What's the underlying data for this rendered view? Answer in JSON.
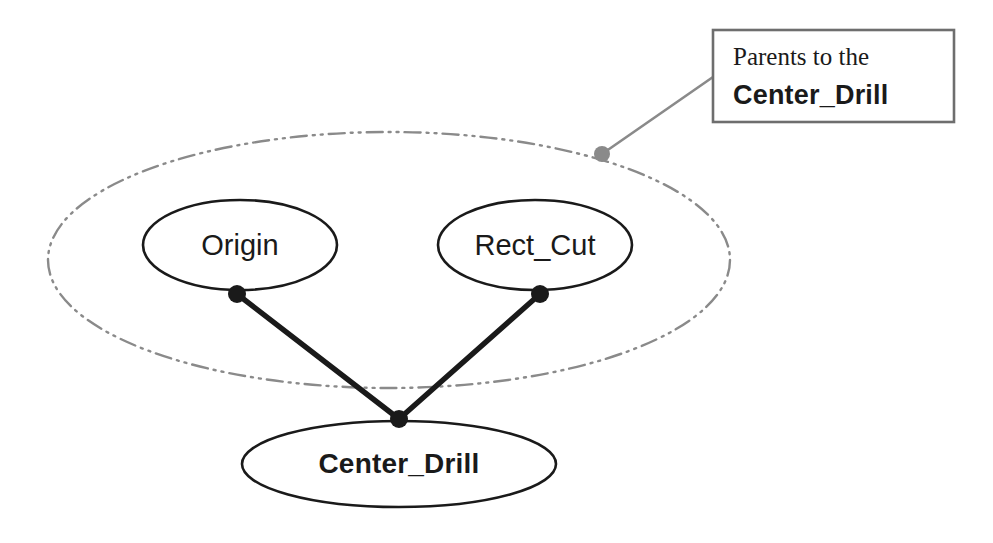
{
  "diagram": {
    "title": "Parents to the Center_Drill",
    "type": "feature-parent-child-tree",
    "colors": {
      "node_stroke": "#1a1a1a",
      "group_stroke": "#8a8a8a",
      "edge": "#1a1a1a",
      "leader": "#8a8a8a",
      "callout_border": "#6e6e6e",
      "background": "#ffffff"
    },
    "group": {
      "name": "parents-group",
      "shape": "ellipse",
      "style": "dash-dot-dot",
      "cx": 389,
      "cy": 260,
      "rx": 341,
      "ry": 128
    },
    "nodes": [
      {
        "id": "origin",
        "label": "Origin",
        "bold": false,
        "cx": 240,
        "cy": 245,
        "rx": 97,
        "ry": 45,
        "anchor": {
          "x": 237,
          "y": 294
        }
      },
      {
        "id": "rect_cut",
        "label": "Rect_Cut",
        "bold": false,
        "cx": 535,
        "cy": 245,
        "rx": 97,
        "ry": 45,
        "anchor": {
          "x": 540,
          "y": 294
        }
      },
      {
        "id": "center_drill",
        "label": "Center_Drill",
        "bold": true,
        "cx": 399,
        "cy": 464,
        "rx": 157,
        "ry": 43,
        "anchor": {
          "x": 399,
          "y": 419
        }
      }
    ],
    "edges": [
      {
        "id": "edge-origin-center-drill",
        "from": "origin",
        "to": "center_drill"
      },
      {
        "id": "edge-rect-cut-center-drill",
        "from": "rect_cut",
        "to": "center_drill"
      }
    ],
    "callout": {
      "line1": "Parents to the",
      "line2": "Center_Drill",
      "box": {
        "x": 713,
        "y": 30,
        "width": 241,
        "height": 92
      },
      "leader": {
        "from": {
          "x": 713,
          "y": 77
        },
        "to": {
          "x": 602,
          "y": 154
        },
        "dot_radius": 8
      }
    }
  }
}
